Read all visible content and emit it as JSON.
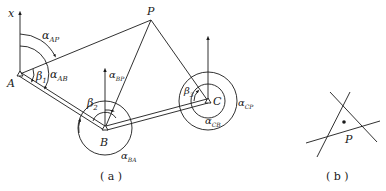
{
  "figure_a": {
    "caption": "( a )",
    "axis_label": "x",
    "points": {
      "A": "A",
      "B": "B",
      "C": "C",
      "P": "P"
    },
    "angles": {
      "alpha_AP": {
        "main": "α",
        "sub": "AP"
      },
      "alpha_AB": {
        "main": "α",
        "sub": "AB"
      },
      "beta_1": {
        "main": "β",
        "sub": "1"
      },
      "alpha_BP": {
        "main": "α",
        "sub": "BP"
      },
      "beta_2": {
        "main": "β",
        "sub": "2"
      },
      "alpha_BA": {
        "main": "α",
        "sub": "BA"
      },
      "beta_3": {
        "main": "β",
        "sub": "3"
      },
      "alpha_CB": {
        "main": "α",
        "sub": "CB"
      },
      "alpha_CP": {
        "main": "α",
        "sub": "CP"
      }
    }
  },
  "figure_b": {
    "caption": "( b )",
    "point_label": "P"
  },
  "colors": {
    "stroke": "#1a1a1a",
    "background": "#ffffff"
  }
}
